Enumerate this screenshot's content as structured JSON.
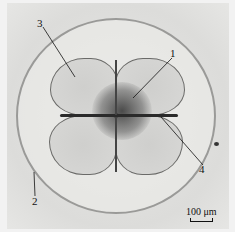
{
  "figure": {
    "labels": [
      {
        "id": "1",
        "text": "1"
      },
      {
        "id": "2",
        "text": "2"
      },
      {
        "id": "3",
        "text": "3"
      },
      {
        "id": "4",
        "text": "4"
      }
    ],
    "scale_bar": {
      "text": "100 μm"
    }
  }
}
